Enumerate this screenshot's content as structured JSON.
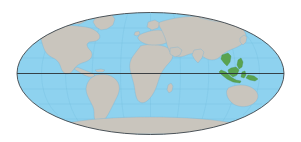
{
  "figure": {
    "type": "world-distribution-map",
    "projection": "Mollweide",
    "title": "",
    "caption": "",
    "background_color": "#ffffff"
  },
  "map": {
    "ocean_color": "#8ed2ef",
    "land_color": "#c9c5bd",
    "land_stroke_color": "#7fb7d4",
    "graticule_color": "#6fb9dd",
    "outline_color": "#3f4448",
    "highlight_color": "#5aa350",
    "highlight_region_label": "Southeast Asia",
    "equator_label": "Equator",
    "equator_line_color": "#2b3034",
    "ellipse": {
      "center_x": 150.5,
      "center_y": 73.5,
      "radius_x": 134,
      "radius_y": 61.5
    },
    "equator_y": 73.5
  },
  "continents": [
    {
      "name": "north-america"
    },
    {
      "name": "south-america"
    },
    {
      "name": "greenland"
    },
    {
      "name": "europe"
    },
    {
      "name": "africa"
    },
    {
      "name": "asia"
    },
    {
      "name": "australia"
    },
    {
      "name": "new-zealand"
    },
    {
      "name": "antarctica"
    },
    {
      "name": "japan"
    },
    {
      "name": "madagascar"
    },
    {
      "name": "british-isles"
    }
  ],
  "highlight_areas": [
    {
      "name": "philippines"
    },
    {
      "name": "borneo"
    },
    {
      "name": "sulawesi"
    },
    {
      "name": "new-guinea"
    },
    {
      "name": "indochina"
    }
  ]
}
